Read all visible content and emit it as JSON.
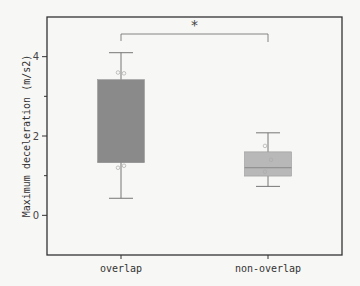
{
  "chart_data": {
    "type": "box",
    "title": "",
    "xlabel": "",
    "ylabel": "Maximum deceleration (m/s2)",
    "ylim": [
      -1,
      5
    ],
    "yticks": [
      0,
      2,
      4
    ],
    "yticks_minor": [
      1,
      3
    ],
    "grid": false,
    "legend": null,
    "categories": [
      "overlap",
      "non-overlap"
    ],
    "boxes": [
      {
        "name": "overlap",
        "whisker_low": 0.43,
        "q1": 1.34,
        "median": 1.34,
        "q3": 3.42,
        "whisker_high": 4.1,
        "fill": "#8a8a8a",
        "points": [
          3.6,
          3.58,
          1.2,
          1.25
        ]
      },
      {
        "name": "non-overlap",
        "whisker_low": 0.73,
        "q1": 0.99,
        "median": 1.2,
        "q3": 1.6,
        "whisker_high": 2.08,
        "fill": "#b8b8b8",
        "points": [
          1.75,
          1.4,
          1.1
        ]
      }
    ],
    "annotations": [
      {
        "type": "significance_bracket",
        "between": [
          "overlap",
          "non-overlap"
        ],
        "label": "*"
      }
    ]
  },
  "labels": {
    "ylabel": "Maximum deceleration (m/s2)",
    "yticks": [
      "0",
      "2",
      "4"
    ],
    "categories": [
      "overlap",
      "non-overlap"
    ],
    "significance": "*"
  }
}
